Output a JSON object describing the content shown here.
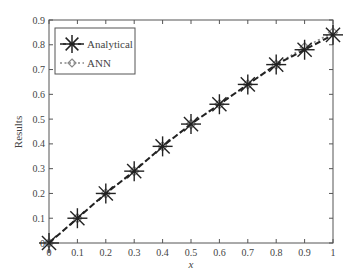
{
  "chart_data": {
    "type": "line",
    "title": "",
    "xlabel": "x",
    "ylabel": "Results",
    "xlim": [
      0,
      1
    ],
    "ylim": [
      0,
      0.9
    ],
    "grid": false,
    "legend_position": "upper left",
    "x_ticks": [
      "0",
      "0.1",
      "0.2",
      "0.3",
      "0.4",
      "0.5",
      "0.6",
      "0.7",
      "0.8",
      "0.9",
      "1"
    ],
    "y_ticks": [
      "0",
      "0.1",
      "0.2",
      "0.3",
      "0.4",
      "0.5",
      "0.6",
      "0.7",
      "0.8",
      "0.9"
    ],
    "x": [
      0,
      0.1,
      0.2,
      0.3,
      0.4,
      0.5,
      0.6,
      0.7,
      0.8,
      0.9,
      1.0
    ],
    "series": [
      {
        "name": "Analytical",
        "marker": "asterisk",
        "line": "dashed",
        "color": "#222222",
        "values": [
          0,
          0.1,
          0.2,
          0.29,
          0.39,
          0.48,
          0.56,
          0.64,
          0.72,
          0.78,
          0.84
        ]
      },
      {
        "name": "ANN",
        "marker": "diamond",
        "line": "dotted",
        "color": "#888888",
        "values": [
          0,
          0.1,
          0.2,
          0.29,
          0.39,
          0.48,
          0.56,
          0.64,
          0.72,
          0.79,
          0.85
        ]
      }
    ]
  }
}
